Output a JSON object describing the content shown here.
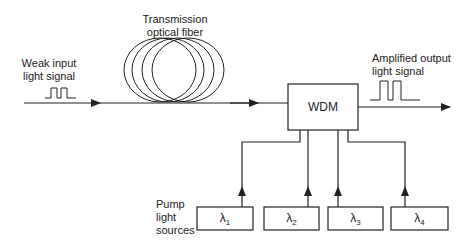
{
  "labels": {
    "input_line1": "Weak input",
    "input_line2": "light signal",
    "fiber_line1": "Transmission",
    "fiber_line2": "optical fiber",
    "output_line1": "Amplified output",
    "output_line2": "light signal",
    "wdm": "WDM",
    "pump_line1": "Pump",
    "pump_line2": "light",
    "pump_line3": "sources"
  },
  "pump_sources": [
    {
      "symbol": "λ",
      "sub": "1"
    },
    {
      "symbol": "λ",
      "sub": "2"
    },
    {
      "symbol": "λ",
      "sub": "3"
    },
    {
      "symbol": "λ",
      "sub": "4"
    }
  ],
  "colors": {
    "stroke": "#222222",
    "background": "#ffffff"
  }
}
